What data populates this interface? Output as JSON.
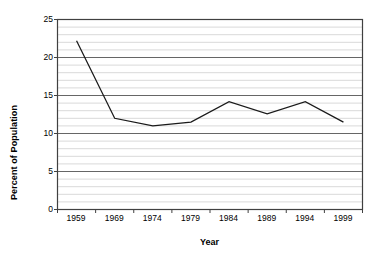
{
  "chart_data": {
    "type": "line",
    "title": "",
    "xlabel": "Year",
    "ylabel": "Percent of Population",
    "categories": [
      "1959",
      "1969",
      "1974",
      "1979",
      "1984",
      "1989",
      "1994",
      "1999"
    ],
    "values": [
      22.2,
      12.0,
      11.0,
      11.5,
      14.2,
      12.6,
      14.2,
      11.5
    ],
    "series": [
      {
        "name": "Percent of Population",
        "values": [
          22.2,
          12.0,
          11.0,
          11.5,
          14.2,
          12.6,
          14.2,
          11.5
        ]
      }
    ],
    "ylim": [
      0,
      25
    ],
    "ytick_values": [
      0,
      5,
      10,
      15,
      20,
      25
    ],
    "ytick_labels": [
      "0",
      "5",
      "10",
      "15",
      "20",
      "25"
    ],
    "ytick_interval": 5,
    "minor_gridline_interval": 1,
    "grid": "horizontal-major-and-minor",
    "legend": "none",
    "line_color": "#1a1a1a",
    "major_gridline_color": "#666666",
    "minor_gridline_color": "#d9d9d9",
    "axis_color": "#404040",
    "plot_background": "#ffffff",
    "markers": "none"
  }
}
